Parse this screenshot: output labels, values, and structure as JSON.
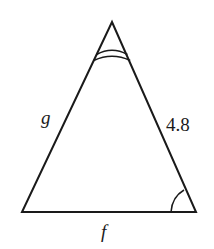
{
  "diagram": {
    "type": "triangle",
    "stroke_color": "#1a1a1a",
    "background": "#ffffff",
    "vertices": {
      "apex": [
        112,
        22
      ],
      "bottom_left": [
        22,
        212
      ],
      "bottom_right": [
        196,
        212
      ]
    },
    "sides": {
      "left": {
        "label": "g",
        "italic": true
      },
      "right": {
        "label": "4.8",
        "italic": false
      },
      "bottom": {
        "label": "f",
        "italic": true
      }
    },
    "angle_marks": {
      "apex": {
        "arcs": 2
      },
      "bottom_right": {
        "arcs": 1
      }
    }
  }
}
